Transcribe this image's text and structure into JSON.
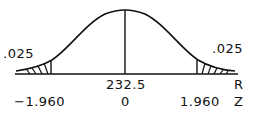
{
  "diagram": {
    "type": "normal-distribution-two-tailed",
    "left_tail_area": ".025",
    "right_tail_area": ".025",
    "mean_raw": "232.5",
    "mean_z": "0",
    "left_critical_z": "−1.960",
    "right_critical_z": "1.960",
    "raw_axis_label": "R",
    "z_axis_label": "Z",
    "colors": {
      "ink": "#111111",
      "background": "#ffffff"
    }
  }
}
